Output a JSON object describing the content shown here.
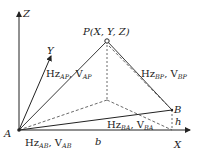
{
  "diagram": {
    "axes": {
      "z_label": "Z",
      "y_label": "Y",
      "x_label": "X"
    },
    "points": {
      "A": {
        "label": "A"
      },
      "B": {
        "label": "B"
      },
      "P": {
        "label": "P(X, Y, Z)"
      }
    },
    "segment_labels": {
      "AP": {
        "main": "Hz",
        "sub1": "AP",
        "sep": ", ",
        "main2": "V",
        "sub2": "AP"
      },
      "BP": {
        "main": "Hz",
        "sub1": "BP",
        "sep": ", ",
        "main2": "V",
        "sub2": "BP"
      },
      "AB": {
        "main": "Hz",
        "sub1": "AB",
        "sep": ", ",
        "main2": "V",
        "sub2": "AB"
      },
      "BA": {
        "main": "Hz",
        "sub1": "BA",
        "sep": ", ",
        "main2": "V",
        "sub2": "BA"
      },
      "baseline": "b",
      "height": "h"
    },
    "colors": {
      "line": "#222222",
      "background": "#ffffff"
    }
  }
}
